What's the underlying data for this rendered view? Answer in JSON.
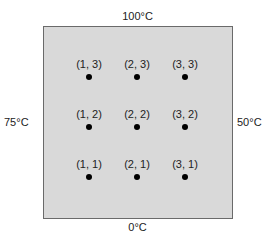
{
  "boundary": {
    "top": "100°C",
    "bottom": "0°C",
    "left": "75°C",
    "right": "50°C"
  },
  "nodes": [
    {
      "label": "(1, 3)",
      "x": 89,
      "y": 58
    },
    {
      "label": "(2, 3)",
      "x": 137,
      "y": 58
    },
    {
      "label": "(3, 3)",
      "x": 185,
      "y": 58
    },
    {
      "label": "(1, 2)",
      "x": 89,
      "y": 108
    },
    {
      "label": "(2, 2)",
      "x": 137,
      "y": 108
    },
    {
      "label": "(3, 2)",
      "x": 185,
      "y": 108
    },
    {
      "label": "(1, 1)",
      "x": 89,
      "y": 158
    },
    {
      "label": "(2, 1)",
      "x": 137,
      "y": 158
    },
    {
      "label": "(3, 1)",
      "x": 185,
      "y": 158
    }
  ]
}
